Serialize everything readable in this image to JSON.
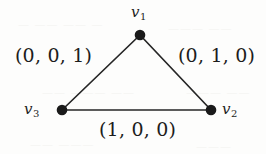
{
  "figure": {
    "type": "undirected-graph-diagram",
    "background_color": "#fdfdfc",
    "ink_color": "#1d1d1d",
    "width": 266,
    "height": 154
  },
  "vertices": [
    {
      "id": "v1",
      "label_v": "v",
      "label_sub": "1",
      "x": 140,
      "y": 35,
      "label_x": 131,
      "label_y": 5
    },
    {
      "id": "v2",
      "label_v": "v",
      "label_sub": "2",
      "x": 211,
      "y": 110,
      "label_x": 222,
      "label_y": 102
    },
    {
      "id": "v3",
      "label_v": "v",
      "label_sub": "3",
      "x": 62,
      "y": 110,
      "label_x": 24,
      "label_y": 102
    }
  ],
  "edges": [
    {
      "id": "e-v1-v3",
      "from": "v3",
      "to": "v1",
      "label": "(0, 0, 1)",
      "label_x": 15,
      "label_y": 46
    },
    {
      "id": "e-v1-v2",
      "from": "v1",
      "to": "v2",
      "label": "(0, 1, 0)",
      "label_x": 178,
      "label_y": 46
    },
    {
      "id": "e-v3-v2",
      "from": "v3",
      "to": "v2",
      "label": "(1, 0, 0)",
      "label_x": 99,
      "label_y": 120
    }
  ],
  "ghosts": [
    {
      "text": "— ——  —— —",
      "x": 18,
      "y": 18
    },
    {
      "text": "———  ——",
      "x": 168,
      "y": 22
    },
    {
      "text": "——  ——— ——",
      "x": 42,
      "y": 86
    },
    {
      "text": "——— ——",
      "x": 186,
      "y": 86
    },
    {
      "text": "——  ———",
      "x": 30,
      "y": 138
    },
    {
      "text": "———",
      "x": 196,
      "y": 140
    }
  ]
}
